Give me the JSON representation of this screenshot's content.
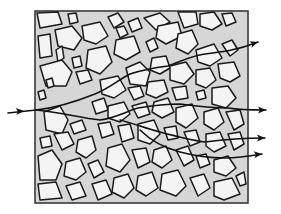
{
  "diagram": {
    "colors": {
      "matrix": "#d6d6d6",
      "grain": "#f4f4f4",
      "outline": "#1a1a1a",
      "flow": "#111111"
    },
    "box": {
      "x": 35,
      "y": 11,
      "w": 213,
      "h": 192
    },
    "grains": [
      "37,13 58,12 62,24 40,28",
      "68,14 76,13 78,22 70,24",
      "55,30 72,26 82,38 74,50 58,46",
      "82,26 100,22 108,36 96,44 84,40",
      "108,17 118,13 124,22 114,28",
      "116,28 124,26 128,34 120,38",
      "128,22 138,18 142,28 132,32",
      "38,36 50,34 52,56 40,58",
      "56,50 62,46 64,58 58,62",
      "88,50 106,46 112,62 100,74 86,68",
      "116,40 134,36 140,52 126,60 114,54",
      "144,18 160,13 170,22 156,30",
      "158,26 178,22 182,36 166,44 156,38",
      "178,12 196,12 198,24 184,28",
      "200,14 214,12 222,24 212,30 200,26",
      "222,14 232,13 236,22 226,26",
      "178,34 192,30 198,44 188,54 176,48",
      "196,50 214,44 222,58 210,66 198,62",
      "222,44 232,40 238,50 230,56",
      "146,42 154,38 158,48 150,52",
      "40,66 62,60 72,72 66,86 46,86",
      "72,58 80,56 82,66 74,68",
      "76,72 88,70 92,80 80,84",
      "38,92 44,90 46,98 40,100",
      "46,80 52,78 54,86 48,88",
      "100,80 118,76 126,90 114,98 102,94",
      "126,68 140,62 150,72 146,86 130,84",
      "152,58 166,56 170,68 160,74 150,70",
      "170,66 186,62 194,74 184,84 170,80",
      "196,70 210,68 216,80 206,88 196,84",
      "218,64 234,62 240,76 230,82 220,78",
      "128,88 140,86 144,96 134,100",
      "148,82 164,80 168,92 156,98 146,94",
      "172,88 186,86 188,98 176,100",
      "196,92 204,90 206,98 198,100",
      "212,88 228,86 236,98 226,108 212,104",
      "44,112 60,106 68,120 62,134 46,130",
      "70,124 82,120 86,130 74,134",
      "92,102 104,98 108,110 96,114",
      "108,106 124,102 130,114 120,122 108,118",
      "132,106 146,102 150,114 138,118",
      "154,102 168,98 174,112 162,118 152,112",
      "176,108 192,104 198,118 186,128 176,122",
      "204,112 218,108 224,122 214,130 204,124",
      "226,112 240,110 244,124 234,130",
      "40,138 50,136 52,146 42,148",
      "54,134 68,132 74,144 62,150",
      "78,140 92,136 96,150 86,158 76,152",
      "98,124 110,122 114,134 102,138",
      "118,126 130,124 134,138 122,142",
      "138,124 154,120 160,134 150,144 138,140",
      "164,128 176,126 178,138 168,140",
      "184,132 196,130 200,142 190,146",
      "206,134 220,132 226,146 214,152 206,146",
      "228,134 240,132 244,144 234,150",
      "38,156 52,150 62,164 56,180 40,180",
      "66,162 80,158 86,172 76,180 64,176",
      "88,164 98,160 104,172 94,178",
      "108,148 122,144 130,160 120,172 106,166",
      "132,150 146,148 150,162 138,168",
      "154,150 166,146 172,160 162,168 152,162",
      "176,150 188,146 194,160 184,166",
      "196,156 206,154 210,164 200,168",
      "214,160 228,156 236,168 226,176 214,172",
      "38,184 56,182 62,198 40,200",
      "66,186 80,182 86,196 72,200",
      "92,184 106,180 112,194 98,200",
      "114,178 128,174 134,188 124,198 112,192",
      "138,176 152,172 158,188 146,196 136,190",
      "162,174 178,170 186,186 176,196 160,190",
      "190,178 204,174 210,188 198,196",
      "214,182 232,178 240,194 224,200 214,196",
      "236,176 244,172 246,184 240,186"
    ],
    "flow_paths": [
      {
        "name": "upper-path",
        "d": "M36,110 C55,108 75,102 95,94 C110,88 118,80 130,74 C142,70 152,68 168,66 C180,62 190,56 205,54 C222,52 238,50 258,42",
        "arrow": "258,42"
      },
      {
        "name": "middle-path",
        "d": "M36,110 C60,112 80,118 100,120 C115,118 125,112 138,108 C150,106 165,104 180,104 C195,106 210,108 228,108 C240,110 252,110 266,110",
        "arrow": "266,110"
      },
      {
        "name": "lower-path",
        "d": "M120,120 C135,124 145,128 160,132 C175,136 190,140 205,142 C220,140 240,138 265,138",
        "arrow": "265,138"
      },
      {
        "name": "bottom-path",
        "d": "M140,130 C150,140 165,148 180,152 C195,156 210,158 225,158 C238,158 250,156 262,154",
        "arrow": "262,154"
      },
      {
        "name": "inlet-path",
        "d": "M8,113 C18,112 26,111 36,110",
        "arrow": ""
      }
    ],
    "inlet_arrow": {
      "x": 22,
      "y": 111
    },
    "arrowheads": [
      {
        "x": 258,
        "y": 42,
        "angle": -18
      },
      {
        "x": 266,
        "y": 110,
        "angle": 0
      },
      {
        "x": 265,
        "y": 138,
        "angle": 0
      },
      {
        "x": 262,
        "y": 154,
        "angle": -6
      },
      {
        "x": 24,
        "y": 111,
        "angle": -4
      }
    ]
  }
}
